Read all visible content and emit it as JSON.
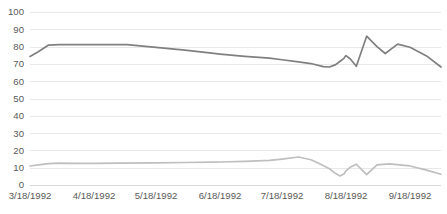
{
  "chart_data": {
    "type": "line",
    "title": "",
    "subtitle": "",
    "xlabel": "",
    "ylabel": "",
    "ylim": [
      0,
      100
    ],
    "ytick_labels": [
      "0",
      "10",
      "20",
      "30",
      "40",
      "50",
      "60",
      "70",
      "80",
      "90",
      "100"
    ],
    "ytick_values": [
      0,
      10,
      20,
      30,
      40,
      50,
      60,
      70,
      80,
      90,
      100
    ],
    "xtick_labels": [
      "3/18/1992",
      "4/18/1992",
      "5/18/1992",
      "6/18/1992",
      "7/18/1992",
      "8/18/1992",
      "9/18/1992"
    ],
    "xtick_positions": [
      0,
      31,
      61,
      92,
      122,
      153,
      184
    ],
    "xlim": [
      0,
      199
    ],
    "grid": true,
    "grid_axis": "y",
    "legend": false,
    "legend_position": "none",
    "colors": {
      "series_upper": "#808080",
      "series_lower": "#bfbfbf",
      "gridline": "#e8e8e8",
      "baseline": "#d9d9d9",
      "text": "#595959",
      "background": "#ffffff"
    },
    "series": [
      {
        "name": "Upper series",
        "color": "#808080",
        "x": [
          0,
          4,
          9,
          14,
          22,
          31,
          42,
          47,
          61,
          75,
          88,
          92,
          104,
          116,
          122,
          130,
          136,
          142,
          145,
          148,
          150,
          152,
          153,
          155,
          158,
          163,
          168,
          172,
          178,
          184,
          192,
          199
        ],
        "values": [
          74.3,
          77.0,
          80.9,
          81.1,
          81.1,
          81.1,
          81.2,
          81.1,
          79.6,
          78.0,
          76.2,
          75.7,
          74.4,
          73.3,
          72.4,
          71.2,
          70.2,
          68.4,
          68.2,
          69.6,
          71.4,
          73.2,
          74.8,
          73.0,
          68.6,
          86.0,
          80.0,
          76.0,
          81.4,
          79.6,
          74.6,
          68.2
        ]
      },
      {
        "name": "Lower series",
        "color": "#bfbfbf",
        "x": [
          0,
          4,
          9,
          14,
          22,
          31,
          42,
          61,
          75,
          88,
          92,
          104,
          116,
          122,
          130,
          136,
          140,
          145,
          148,
          150,
          152,
          153,
          155,
          158,
          163,
          168,
          174,
          184,
          192,
          199
        ],
        "values": [
          11.0,
          11.6,
          12.4,
          12.6,
          12.5,
          12.5,
          12.6,
          12.8,
          13.0,
          13.2,
          13.3,
          13.6,
          14.2,
          15.0,
          16.2,
          14.6,
          12.4,
          9.4,
          6.6,
          5.2,
          6.4,
          8.2,
          10.2,
          12.0,
          6.0,
          11.6,
          12.2,
          11.0,
          8.6,
          6.2
        ]
      }
    ]
  },
  "plot_area": {
    "left": 30,
    "top": 12,
    "right": 441,
    "bottom": 185
  }
}
